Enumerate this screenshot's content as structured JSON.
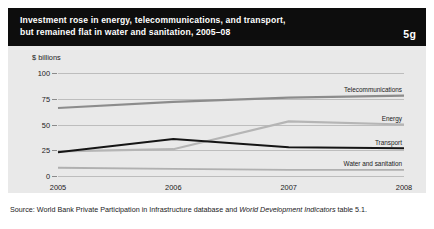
{
  "header": {
    "title": "Investment rose in energy, telecommunications, and transport,\nbut remained flat in water and sanitation, 2005–08",
    "badge": "5g",
    "background": "#0d0d0d",
    "text_color": "#ffffff"
  },
  "source": {
    "prefix": "Source: World Bank Private Participation in Infrastructure database and ",
    "italic": "World Development Indicators",
    "suffix": " table 5.1."
  },
  "chart_data": {
    "type": "line",
    "title": "Investment rose in energy, telecommunications, and transport, but remained flat in water and sanitation, 2005–08",
    "xlabel": "",
    "ylabel": "$ billions",
    "unit_label": "$ billions",
    "x": [
      "2005",
      "2006",
      "2007",
      "2008"
    ],
    "xticklabels": [
      "2005",
      "2006",
      "2007",
      "2008"
    ],
    "yticks": [
      0,
      25,
      50,
      75,
      100
    ],
    "yticklabels": [
      "0",
      "25",
      "50",
      "75",
      "100"
    ],
    "ylim": [
      0,
      100
    ],
    "grid": true,
    "legend_position": "inline-right-of-line",
    "plot_background": "#e9e9e9",
    "series": [
      {
        "name": "Telecommunications",
        "values": [
          66,
          72,
          76,
          78
        ],
        "color": "#8c8c8c",
        "width": 2.2
      },
      {
        "name": "Energy",
        "values": [
          24,
          26,
          53,
          50
        ],
        "color": "#b5b5b5",
        "width": 2.2
      },
      {
        "name": "Transport",
        "values": [
          23,
          36,
          28,
          27
        ],
        "color": "#151515",
        "width": 2.0
      },
      {
        "name": "Water and sanitation",
        "values": [
          8,
          7,
          6,
          6
        ],
        "color": "#b0b0b0",
        "width": 1.8
      }
    ]
  }
}
